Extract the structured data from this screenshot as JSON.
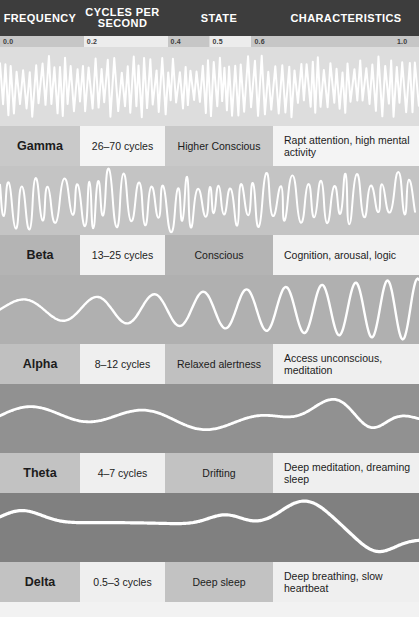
{
  "header": {
    "columns": [
      {
        "key": "frequency",
        "label": "FREQUENCY"
      },
      {
        "key": "cycles",
        "label": "CYCLES PER SECOND"
      },
      {
        "key": "state",
        "label": "STATE"
      },
      {
        "key": "characteristics",
        "label": "CHARACTERISTICS"
      }
    ],
    "background_color": "#3d3d3d",
    "text_color": "#ffffff"
  },
  "ruler": {
    "ticks": [
      {
        "label": "0.0",
        "position": 0.0
      },
      {
        "label": "0.2",
        "position": 0.2
      },
      {
        "label": "0.4",
        "position": 0.4
      },
      {
        "label": "0.5",
        "position": 0.5
      },
      {
        "label": "0.6",
        "position": 0.6
      },
      {
        "label": "1.0",
        "position": 1.0
      }
    ]
  },
  "rows": [
    {
      "name": "Gamma",
      "cycles": "26–70 cycles",
      "state": "Higher Conscious",
      "characteristics": "Rapt attention, high mental activity",
      "band_color": "#dddddd",
      "name_cell_color": "#c9c9c9",
      "cycles_cell_color": "#f4f4f4",
      "state_cell_color": "#c9c9c9",
      "char_cell_color": "#f4f4f4"
    },
    {
      "name": "Beta",
      "cycles": "13–25 cycles",
      "state": "Conscious",
      "characteristics": "Cognition, arousal, logic",
      "band_color": "#c4c4c4",
      "name_cell_color": "#b4b4b4",
      "cycles_cell_color": "#f2f2f2",
      "state_cell_color": "#b4b4b4",
      "char_cell_color": "#f2f2f2"
    },
    {
      "name": "Alpha",
      "cycles": "8–12 cycles",
      "state": "Relaxed alertness",
      "characteristics": "Access unconscious, meditation",
      "band_color": "#b0b0b0",
      "name_cell_color": "#c0c0c0",
      "cycles_cell_color": "#efefef",
      "state_cell_color": "#c0c0c0",
      "char_cell_color": "#efefef"
    },
    {
      "name": "Theta",
      "cycles": "4–7 cycles",
      "state": "Drifting",
      "characteristics": "Deep meditation, dreaming sleep",
      "band_color": "#919191",
      "name_cell_color": "#c2c2c2",
      "cycles_cell_color": "#efefef",
      "state_cell_color": "#c2c2c2",
      "char_cell_color": "#efefef"
    },
    {
      "name": "Delta",
      "cycles": "0.5–3 cycles",
      "state": "Deep sleep",
      "characteristics": "Deep breathing, slow heartbeat",
      "band_color": "#808080",
      "name_cell_color": "#c2c2c2",
      "cycles_cell_color": "#efefef",
      "state_cell_color": "#c2c2c2",
      "char_cell_color": "#efefef"
    }
  ],
  "chart_data": {
    "type": "line",
    "title": "",
    "xlabel": "",
    "ylabel": "",
    "xlim": [
      0.0,
      1.0
    ],
    "grid": false,
    "legend": "none",
    "wave_color": "#ffffff",
    "series": [
      {
        "name": "Gamma",
        "frequency_hz": "26-70",
        "amplitude": 0.3,
        "cycles_drawn": 46,
        "description": "very fast low-amplitude irregular spikes"
      },
      {
        "name": "Beta",
        "frequency_hz": "13-25",
        "amplitude": 0.45,
        "cycles_drawn": 22,
        "description": "fast irregular medium-amplitude waves"
      },
      {
        "name": "Alpha",
        "frequency_hz": "8-12",
        "amplitude": 0.7,
        "cycles_drawn": 9,
        "description": "smooth sinusoidal waves with increasing amplitude"
      },
      {
        "name": "Theta",
        "frequency_hz": "4-7",
        "amplitude": 0.8,
        "cycles_drawn": 6,
        "description": "slow rolling waves with one large excursion"
      },
      {
        "name": "Delta",
        "frequency_hz": "0.5-3",
        "amplitude": 0.95,
        "cycles_drawn": 3,
        "description": "very slow very large amplitude waves"
      }
    ]
  }
}
